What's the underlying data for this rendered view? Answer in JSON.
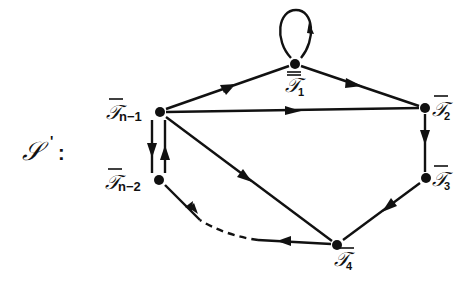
{
  "graph": {
    "title": "𝒮′:",
    "title_script": "𝒮",
    "title_prime": "'",
    "title_colon": ":",
    "nodes": [
      {
        "id": "T1",
        "label": "𝒯",
        "sub": "1",
        "x": 295,
        "y": 64
      },
      {
        "id": "T2",
        "label": "𝒯",
        "sub": "2",
        "x": 425,
        "y": 108
      },
      {
        "id": "T3",
        "label": "𝒯",
        "sub": "3",
        "x": 426,
        "y": 178
      },
      {
        "id": "T4",
        "label": "𝒯",
        "sub": "4",
        "x": 337,
        "y": 245
      },
      {
        "id": "Tn-2",
        "label": "𝒯",
        "sub": "n−2",
        "x": 159,
        "y": 180
      },
      {
        "id": "Tn-1",
        "label": "𝒯",
        "sub": "n−1",
        "x": 160,
        "y": 112
      }
    ],
    "edges": [
      {
        "from": "T1",
        "to": "T1",
        "style": "solid",
        "type": "self-loop"
      },
      {
        "from": "Tn-1",
        "to": "T1",
        "style": "solid"
      },
      {
        "from": "T1",
        "to": "T2",
        "style": "solid"
      },
      {
        "from": "Tn-1",
        "to": "T2",
        "style": "solid"
      },
      {
        "from": "T2",
        "to": "T3",
        "style": "solid"
      },
      {
        "from": "T3",
        "to": "T4",
        "style": "solid"
      },
      {
        "from": "Tn-1",
        "to": "T4",
        "style": "solid"
      },
      {
        "from": "T4",
        "to": "Tn-2",
        "style": "dashed"
      },
      {
        "from": "Tn-1",
        "to": "Tn-2",
        "style": "solid"
      },
      {
        "from": "Tn-2",
        "to": "Tn-1",
        "style": "solid"
      }
    ],
    "colors": {
      "ink": "#111111",
      "background": "#ffffff"
    }
  }
}
